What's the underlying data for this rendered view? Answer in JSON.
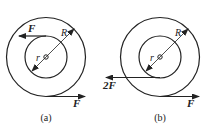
{
  "figures": [
    {
      "id": "a",
      "caption": "(a)",
      "outer_radius_label": "R",
      "inner_radius_label": "r",
      "forces": [
        {
          "label": "F",
          "position": "inner top, pointing left"
        },
        {
          "label": "F",
          "position": "outer bottom, pointing right"
        }
      ]
    },
    {
      "id": "b",
      "caption": "(b)",
      "outer_radius_label": "R",
      "inner_radius_label": "r",
      "forces": [
        {
          "label": "2F",
          "position": "inner bottom, pointing left"
        },
        {
          "label": "F",
          "position": "outer bottom, pointing right"
        }
      ]
    }
  ],
  "colors": {
    "stroke": "#222222",
    "background": "#ffffff"
  }
}
